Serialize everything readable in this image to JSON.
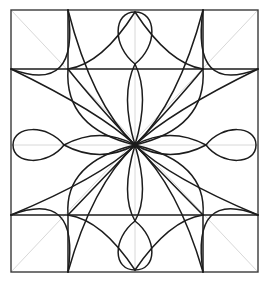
{
  "figure": {
    "canvas": {
      "width": 269,
      "height": 282,
      "background_color": "#ffffff"
    },
    "frame": {
      "left": 11,
      "top": 10,
      "right": 258,
      "bottom": 272,
      "stroke_color": "#3a3a3a",
      "stroke_width": 1.4
    },
    "center": {
      "x": 135,
      "y": 145
    },
    "grid": {
      "x_left": 68,
      "x_mid": 135,
      "x_right": 203,
      "y_top": 69,
      "y_mid": 145,
      "y_bottom": 215
    },
    "guides": {
      "stroke_color": "#d8d8d8",
      "stroke_width": 1,
      "lines": [
        {
          "name": "horizontal-axis",
          "x1": 11,
          "y1": 145,
          "x2": 258,
          "y2": 145
        },
        {
          "name": "vertical-axis",
          "x1": 135,
          "y1": 10,
          "x2": 135,
          "y2": 272
        },
        {
          "name": "diagonal-nw-se",
          "x1": 11,
          "y1": 10,
          "x2": 258,
          "y2": 272
        },
        {
          "name": "diagonal-ne-sw",
          "x1": 258,
          "y1": 10,
          "x2": 11,
          "y2": 272
        }
      ]
    },
    "strokes": {
      "primary_color": "#1c1c1c",
      "primary_width": 1.5
    },
    "nodes": [
      {
        "name": "node-top-left",
        "x": 68,
        "y": 69
      },
      {
        "name": "node-top-right",
        "x": 203,
        "y": 69
      },
      {
        "name": "node-bottom-left",
        "x": 68,
        "y": 215
      },
      {
        "name": "node-bottom-right",
        "x": 203,
        "y": 215
      }
    ],
    "loops": [
      {
        "name": "loop-top",
        "edge": "top",
        "tip_x": 135,
        "tip_y": 12,
        "neck_x": 135,
        "neck_y": 64,
        "half_width": 20
      },
      {
        "name": "loop-bottom",
        "edge": "bottom",
        "tip_x": 135,
        "tip_y": 270,
        "neck_x": 135,
        "neck_y": 221,
        "half_width": 20
      },
      {
        "name": "loop-left",
        "edge": "left",
        "tip_x": 13,
        "tip_y": 145,
        "neck_x": 64,
        "neck_y": 145,
        "half_width": 20
      },
      {
        "name": "loop-right",
        "edge": "right",
        "tip_x": 256,
        "tip_y": 145,
        "neck_x": 206,
        "neck_y": 145,
        "half_width": 20
      }
    ],
    "petal_count": 8,
    "outer_arc_count": 4
  }
}
